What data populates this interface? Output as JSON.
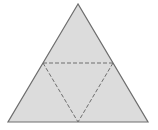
{
  "diagram": {
    "type": "triangle-net",
    "colors": {
      "fill": "#dcdcdc",
      "outline": "#6e6e6e",
      "fold_line": "#6e6e6e",
      "background": "#ffffff"
    },
    "outer_triangle": {
      "apex": [
        78,
        4
      ],
      "bottom_left": [
        8,
        122
      ],
      "bottom_right": [
        148,
        122
      ]
    },
    "fold_lines": [
      {
        "from": [
          43,
          63
        ],
        "to": [
          113,
          63
        ]
      },
      {
        "from": [
          43,
          63
        ],
        "to": [
          78,
          122
        ]
      },
      {
        "from": [
          113,
          63
        ],
        "to": [
          78,
          122
        ]
      }
    ]
  }
}
